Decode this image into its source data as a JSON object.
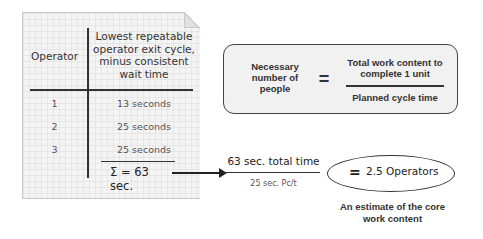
{
  "worksheet": {
    "headers": {
      "operator": "Operator",
      "time": "Lowest repeatable operator exit cycle, minus consistent wait time"
    },
    "rows": [
      {
        "operator": "1",
        "time": "13 seconds"
      },
      {
        "operator": "2",
        "time": "25 seconds"
      },
      {
        "operator": "3",
        "time": "25 seconds"
      }
    ],
    "sum": "Σ = 63 sec."
  },
  "formula": {
    "lhs": "Necessary number of people",
    "equals": "=",
    "numerator": "Total work content to complete 1 unit",
    "denominator": "Planned cycle time"
  },
  "calculation": {
    "numerator": "63 sec. total time",
    "denominator": "25 sec. Pc/t",
    "equals": "=",
    "result": "2.5 Operators",
    "caption": "An estimate of the core work content"
  },
  "icons": {
    "arrow": "arrow-right-icon",
    "paper_fold": "folded-corner-icon"
  }
}
